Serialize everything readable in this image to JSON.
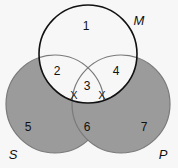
{
  "diagram": {
    "type": "venn-3",
    "colors": {
      "shaded": "#9b9b9b",
      "shaded_stroke": "#7a7a7a",
      "unshaded": "#f7f7f7",
      "outline": "#111111"
    },
    "circles": [
      {
        "label": "M",
        "shaded": false
      },
      {
        "label": "S",
        "shaded": true
      },
      {
        "label": "P",
        "shaded": true
      }
    ],
    "regions": [
      {
        "id": "1",
        "label": "1"
      },
      {
        "id": "2",
        "label": "2"
      },
      {
        "id": "3",
        "label": "3"
      },
      {
        "id": "4",
        "label": "4"
      },
      {
        "id": "5",
        "label": "5"
      },
      {
        "id": "6",
        "label": "6"
      },
      {
        "id": "7",
        "label": "7"
      }
    ],
    "marks": [
      {
        "symbol": "X",
        "position": "boundary of region 3 and 6 on S"
      },
      {
        "symbol": "X",
        "position": "boundary of region 3 and 6 on P"
      }
    ]
  }
}
